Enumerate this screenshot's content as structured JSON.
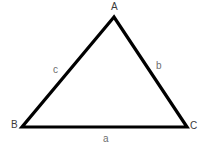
{
  "diagram": {
    "type": "triangle",
    "canvas": {
      "width": 207,
      "height": 149,
      "background": "#ffffff"
    },
    "stroke": {
      "color": "#000000",
      "width": 3.2,
      "linejoin": "miter",
      "linecap": "butt"
    },
    "vertices": [
      {
        "id": "A",
        "label": "A",
        "x": 114,
        "y": 17
      },
      {
        "id": "B",
        "label": "B",
        "x": 22,
        "y": 127
      },
      {
        "id": "C",
        "label": "C",
        "x": 187,
        "y": 127
      }
    ],
    "sides": [
      {
        "id": "a",
        "label": "a",
        "from": "B",
        "to": "C",
        "opposite_vertex": "A"
      },
      {
        "id": "b",
        "label": "b",
        "from": "A",
        "to": "C",
        "opposite_vertex": "B"
      },
      {
        "id": "c",
        "label": "c",
        "from": "A",
        "to": "B",
        "opposite_vertex": "C"
      }
    ],
    "label_colors": {
      "vertex": "#3a3a3a",
      "side": "#6e6e6e"
    }
  }
}
